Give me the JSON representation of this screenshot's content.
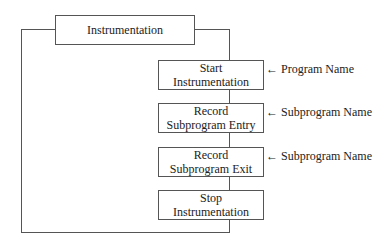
{
  "diagram": {
    "title_box": {
      "label": "Instrumentation"
    },
    "steps": [
      {
        "line1": "Start",
        "line2": "Instrumentation",
        "annotation": "← Program Name"
      },
      {
        "line1": "Record",
        "line2": "Subprogram Entry",
        "annotation": "← Subprogram Name"
      },
      {
        "line1": "Record",
        "line2": "Subprogram Exit",
        "annotation": "← Subprogram Name"
      },
      {
        "line1": "Stop",
        "line2": "Instrumentation",
        "annotation": ""
      }
    ],
    "colors": {
      "line": "#555555",
      "text": "#222222",
      "background": "#ffffff"
    }
  }
}
